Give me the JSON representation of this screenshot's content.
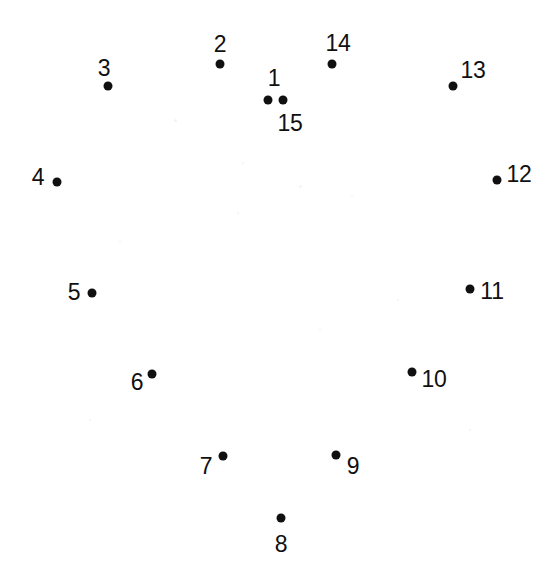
{
  "page": {
    "background_color": "#ffffff",
    "dot_color": "#101010",
    "label_color": "#101010",
    "width": 554,
    "height": 571,
    "dot_radius": 4.5,
    "label_font_size": 23
  },
  "chart_data": {
    "type": "scatter",
    "title": "",
    "xlabel": "",
    "ylabel": "",
    "xlim": [
      0,
      554
    ],
    "ylim": [
      0,
      571
    ],
    "grid": false,
    "legend": null,
    "point_labels": [
      "1",
      "2",
      "3",
      "4",
      "5",
      "6",
      "7",
      "8",
      "9",
      "10",
      "11",
      "12",
      "13",
      "14",
      "15"
    ],
    "x": [
      283,
      220,
      108,
      57,
      92,
      152,
      223,
      281,
      336,
      412,
      470,
      497,
      453,
      332,
      268
    ],
    "y": [
      100,
      64,
      86,
      182,
      293,
      374,
      456,
      518,
      455,
      372,
      289,
      180,
      86,
      64,
      100
    ]
  },
  "dots": [
    {
      "id": "1",
      "label": "1",
      "x": 283,
      "y": 100,
      "label_x": 274,
      "label_y": 78
    },
    {
      "id": "2",
      "label": "2",
      "x": 220,
      "y": 64,
      "label_x": 220,
      "label_y": 44
    },
    {
      "id": "3",
      "label": "3",
      "x": 108,
      "y": 86,
      "label_x": 104,
      "label_y": 68
    },
    {
      "id": "4",
      "label": "4",
      "x": 57,
      "y": 182,
      "label_x": 38,
      "label_y": 177
    },
    {
      "id": "5",
      "label": "5",
      "x": 92,
      "y": 293,
      "label_x": 74,
      "label_y": 292
    },
    {
      "id": "6",
      "label": "6",
      "x": 152,
      "y": 374,
      "label_x": 137,
      "label_y": 382
    },
    {
      "id": "7",
      "label": "7",
      "x": 223,
      "y": 456,
      "label_x": 206,
      "label_y": 466
    },
    {
      "id": "8",
      "label": "8",
      "x": 281,
      "y": 518,
      "label_x": 281,
      "label_y": 544
    },
    {
      "id": "9",
      "label": "9",
      "x": 336,
      "y": 455,
      "label_x": 353,
      "label_y": 466
    },
    {
      "id": "10",
      "label": "10",
      "x": 412,
      "y": 372,
      "label_x": 434,
      "label_y": 379
    },
    {
      "id": "11",
      "label": "11",
      "x": 470,
      "y": 289,
      "label_x": 492,
      "label_y": 291
    },
    {
      "id": "12",
      "label": "12",
      "x": 497,
      "y": 180,
      "label_x": 519,
      "label_y": 174
    },
    {
      "id": "13",
      "label": "13",
      "x": 453,
      "y": 86,
      "label_x": 473,
      "label_y": 70
    },
    {
      "id": "14",
      "label": "14",
      "x": 332,
      "y": 64,
      "label_x": 338,
      "label_y": 43
    },
    {
      "id": "15",
      "label": "15",
      "x": 268,
      "y": 100,
      "label_x": 290,
      "label_y": 123
    }
  ],
  "speckles": [
    {
      "x": 175,
      "y": 120,
      "size": 3
    },
    {
      "x": 243,
      "y": 163,
      "size": 2
    },
    {
      "x": 300,
      "y": 186,
      "size": 3
    },
    {
      "x": 238,
      "y": 213,
      "size": 2
    },
    {
      "x": 352,
      "y": 196,
      "size": 2
    },
    {
      "x": 120,
      "y": 242,
      "size": 2
    },
    {
      "x": 398,
      "y": 300,
      "size": 2
    },
    {
      "x": 470,
      "y": 430,
      "size": 2
    },
    {
      "x": 90,
      "y": 420,
      "size": 2
    },
    {
      "x": 320,
      "y": 330,
      "size": 2
    }
  ]
}
